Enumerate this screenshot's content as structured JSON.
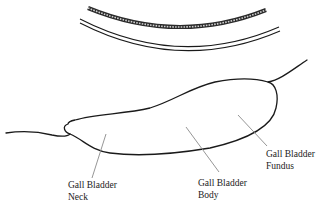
{
  "diagram": {
    "labels": [
      {
        "id": "neck",
        "line1": "Gall Bladder",
        "line2": "Neck"
      },
      {
        "id": "body",
        "line1": "Gall Bladder",
        "line2": "Body"
      },
      {
        "id": "fundus",
        "line1": "Gall Bladder",
        "line2": "Fundus"
      }
    ],
    "colors": {
      "outline": "#1a1a1a",
      "leader": "#8a8a8a",
      "text": "#222222",
      "background": "#ffffff"
    }
  }
}
